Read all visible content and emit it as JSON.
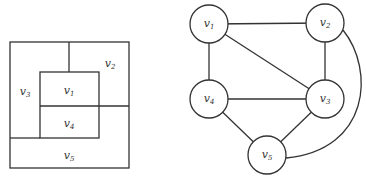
{
  "map": {
    "regions": [
      {
        "id": "v1",
        "base": "v",
        "sub": "1",
        "x": 69,
        "y": 91
      },
      {
        "id": "v2",
        "base": "v",
        "sub": "2",
        "x": 110,
        "y": 64
      },
      {
        "id": "v3",
        "base": "v",
        "sub": "3",
        "x": 25,
        "y": 92
      },
      {
        "id": "v4",
        "base": "v",
        "sub": "4",
        "x": 69,
        "y": 124
      },
      {
        "id": "v5",
        "base": "v",
        "sub": "5",
        "x": 69,
        "y": 156
      }
    ]
  },
  "graph": {
    "nodes": [
      {
        "id": "v1",
        "base": "v",
        "sub": "1",
        "x": 209,
        "y": 24
      },
      {
        "id": "v2",
        "base": "v",
        "sub": "2",
        "x": 325,
        "y": 23
      },
      {
        "id": "v3",
        "base": "v",
        "sub": "3",
        "x": 325,
        "y": 99
      },
      {
        "id": "v4",
        "base": "v",
        "sub": "4",
        "x": 209,
        "y": 99
      },
      {
        "id": "v5",
        "base": "v",
        "sub": "5",
        "x": 267,
        "y": 155
      }
    ],
    "edges": [
      [
        "v1",
        "v2"
      ],
      [
        "v1",
        "v4"
      ],
      [
        "v1",
        "v3"
      ],
      [
        "v2",
        "v3"
      ],
      [
        "v4",
        "v3"
      ],
      [
        "v4",
        "v5"
      ],
      [
        "v3",
        "v5"
      ],
      [
        "v2",
        "v5"
      ]
    ]
  }
}
